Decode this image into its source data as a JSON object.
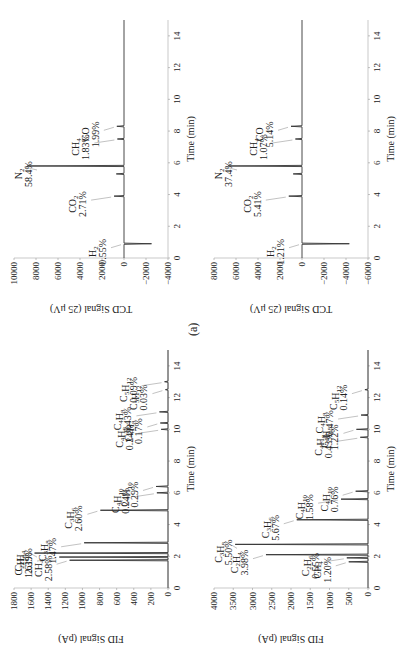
{
  "figure_label": "(a)",
  "chart_data": [
    {
      "id": "fid_top",
      "type": "line",
      "title": "",
      "xlabel": "Time (min)",
      "ylabel": "FID Signal (pA)",
      "xlim": [
        0,
        15
      ],
      "ylim": [
        0,
        1800
      ],
      "xticks": [
        0,
        2,
        4,
        6,
        8,
        10,
        12,
        14
      ],
      "yticks": [
        0,
        200,
        400,
        600,
        800,
        1000,
        1200,
        1400,
        1600,
        1800
      ],
      "grid": false,
      "peaks": [
        {
          "label": "CH4",
          "pct": "2.58%",
          "t": 1.75,
          "h": 1150
        },
        {
          "label": "C2H6",
          "pct": "1.61%",
          "t": 1.95,
          "h": 1270
        },
        {
          "label": "C2H4",
          "pct": "2.39%",
          "t": 2.2,
          "h": 1560
        },
        {
          "label": "C3H8",
          "pct": "1.47%",
          "t": 2.85,
          "h": 980
        },
        {
          "label": "C3H6",
          "pct": "2.60%",
          "t": 4.9,
          "h": 790
        },
        {
          "label": "C4H10",
          "pct": "0.24%",
          "t": 6.0,
          "h": 130
        },
        {
          "label": "C4H10",
          "pct": "0.29%",
          "t": 6.4,
          "h": 140
        },
        {
          "label": "C4H8",
          "pct": "0.24%",
          "t": 10.0,
          "h": 80
        },
        {
          "label": "C4H8",
          "pct": "0.17%",
          "t": 10.4,
          "h": 90
        },
        {
          "label": "C4H8",
          "pct": "0.43%",
          "t": 11.1,
          "h": 100
        },
        {
          "label": "C5H12",
          "pct": "0.03%",
          "t": 12.5,
          "h": 30
        },
        {
          "label": "C5H12",
          "pct": "0.09%",
          "t": 13.0,
          "h": 40
        }
      ]
    },
    {
      "id": "tcd_top",
      "type": "line",
      "title": "",
      "xlabel": "Time (min)",
      "ylabel": "TCD Signal (25 μV)",
      "xlim": [
        0,
        15
      ],
      "ylim": [
        -4000,
        10000
      ],
      "xticks": [
        0,
        2,
        4,
        6,
        8,
        10,
        12,
        14
      ],
      "yticks": [
        -4000,
        -2000,
        0,
        2000,
        4000,
        6000,
        8000,
        10000
      ],
      "grid": false,
      "peaks": [
        {
          "label": "H2",
          "pct": "0.55%",
          "t": 0.9,
          "h": -2500
        },
        {
          "label": "CO2",
          "pct": "2.71%",
          "t": 3.9,
          "h": 900
        },
        {
          "label": "",
          "pct": "",
          "t": 5.3,
          "h": 700
        },
        {
          "label": "N2",
          "pct": "58.4%",
          "t": 5.8,
          "h": 8800
        },
        {
          "label": "CH4",
          "pct": "1.83%",
          "t": 7.5,
          "h": 600
        },
        {
          "label": "CO",
          "pct": "1.99%",
          "t": 8.3,
          "h": 650
        }
      ]
    },
    {
      "id": "fid_bottom",
      "type": "line",
      "title": "",
      "xlabel": "Time (min)",
      "ylabel": "FID Signal (pA)",
      "xlim": [
        0,
        15
      ],
      "ylim": [
        0,
        4000
      ],
      "xticks": [
        0,
        2,
        4,
        6,
        8,
        10,
        12,
        14
      ],
      "yticks": [
        0,
        500,
        1000,
        1500,
        2000,
        2500,
        3000,
        3500,
        4000
      ],
      "grid": false,
      "peaks": [
        {
          "label": "CH4",
          "pct": "1.20%",
          "t": 1.65,
          "h": 500
        },
        {
          "label": "C2H6",
          "pct": "0.55%",
          "t": 1.9,
          "h": 550
        },
        {
          "label": "C2H4",
          "pct": "3.98%",
          "t": 2.1,
          "h": 2650
        },
        {
          "label": "C3H8",
          "pct": "5.50%",
          "t": 2.75,
          "h": 3450
        },
        {
          "label": "C3H6",
          "pct": "5.67%",
          "t": 4.3,
          "h": 1850
        },
        {
          "label": "C4H10",
          "pct": "1.58%",
          "t": 5.6,
          "h": 700
        },
        {
          "label": "C4H10",
          "pct": "0.76%",
          "t": 6.1,
          "h": 320
        },
        {
          "label": "C4H8",
          "pct": "0.43%",
          "t": 9.5,
          "h": 200
        },
        {
          "label": "C4H8",
          "pct": "1.22%",
          "t": 10.0,
          "h": 300
        },
        {
          "label": "C4H8",
          "pct": "0.47%",
          "t": 10.9,
          "h": 180
        },
        {
          "label": "C5H12",
          "pct": "0.14%",
          "t": 12.5,
          "h": 80
        }
      ]
    },
    {
      "id": "tcd_bottom",
      "type": "line",
      "title": "",
      "xlabel": "Time (min)",
      "ylabel": "TCD Signal (25 μV)",
      "xlim": [
        0,
        15
      ],
      "ylim": [
        -6000,
        8000
      ],
      "xticks": [
        0,
        2,
        4,
        6,
        8,
        10,
        12,
        14
      ],
      "yticks": [
        -6000,
        -4000,
        -2000,
        0,
        2000,
        4000,
        6000,
        8000
      ],
      "grid": false,
      "peaks": [
        {
          "label": "H2",
          "pct": "1.21%",
          "t": 0.9,
          "h": -4300
        },
        {
          "label": "CO2",
          "pct": "5.41%",
          "t": 3.9,
          "h": 1200
        },
        {
          "label": "",
          "pct": "",
          "t": 5.3,
          "h": 800
        },
        {
          "label": "N2",
          "pct": "37.4%",
          "t": 5.8,
          "h": 6700
        },
        {
          "label": "CH4",
          "pct": "1.07%",
          "t": 7.5,
          "h": 600
        },
        {
          "label": "CO",
          "pct": "5.14%",
          "t": 8.3,
          "h": 1000
        }
      ]
    }
  ]
}
